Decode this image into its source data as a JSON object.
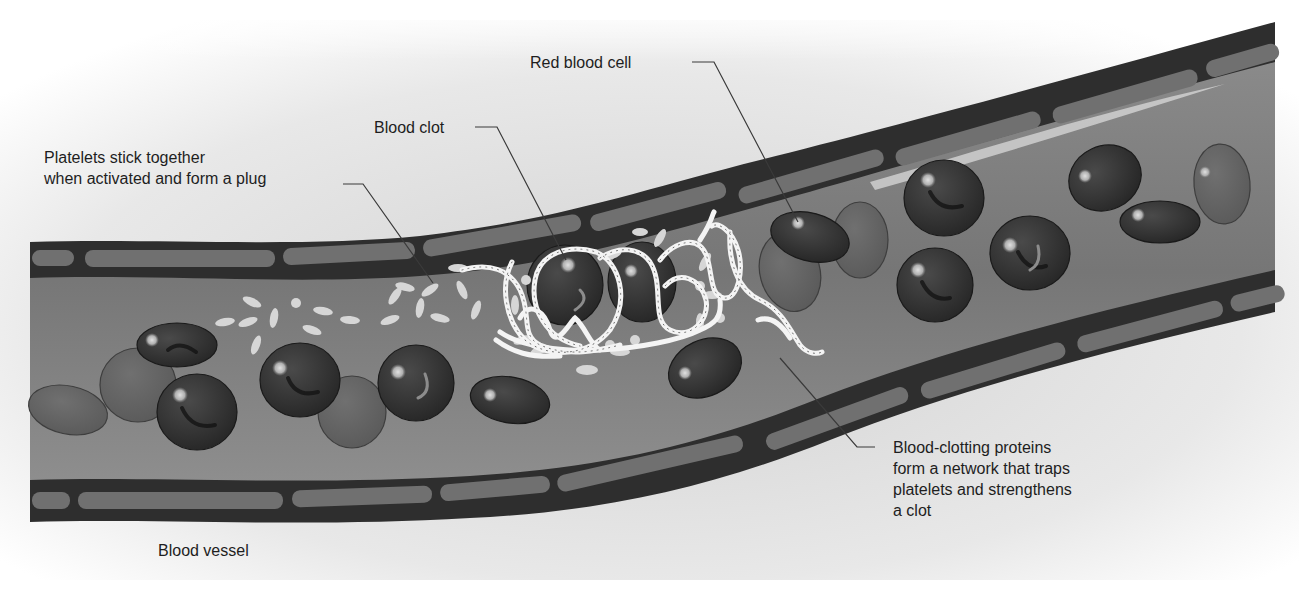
{
  "diagram": {
    "colors": {
      "background": "#ffffff",
      "backdrop_gray": "#e6e6e6",
      "vessel_wall_dark": "#2b2b2b",
      "vessel_wall_segment": "#6e6e6e",
      "lumen": "#7a7a7a",
      "lumen_light": "#9a9a9a",
      "rbc_dark": "#333333",
      "rbc_faded": "#6a6a6a",
      "rbc_highlight": "#bdbdbd",
      "platelet": "#d8d8d8",
      "fibrin": "#f2f2f2",
      "leader_line": "#3a3a3a",
      "text": "#1e1e1e"
    },
    "labels": {
      "platelets": {
        "lines": [
          "Platelets stick together",
          "when activated and form a plug"
        ]
      },
      "blood_clot": {
        "lines": [
          "Blood clot"
        ]
      },
      "red_blood_cell": {
        "lines": [
          "Red blood cell"
        ]
      },
      "clotting_proteins": {
        "lines": [
          "Blood-clotting proteins",
          "form a network that traps",
          "platelets and strengthens",
          "a clot"
        ]
      },
      "blood_vessel": {
        "lines": [
          "Blood vessel"
        ]
      }
    },
    "components": [
      {
        "id": "platelets",
        "name": "Platelets",
        "description": "Stick together when activated and form a plug"
      },
      {
        "id": "blood_clot",
        "name": "Blood clot"
      },
      {
        "id": "red_blood_cell",
        "name": "Red blood cell"
      },
      {
        "id": "clotting_proteins",
        "name": "Blood-clotting proteins",
        "description": "Form a network that traps platelets and strengthens a clot"
      },
      {
        "id": "blood_vessel",
        "name": "Blood vessel"
      }
    ]
  }
}
